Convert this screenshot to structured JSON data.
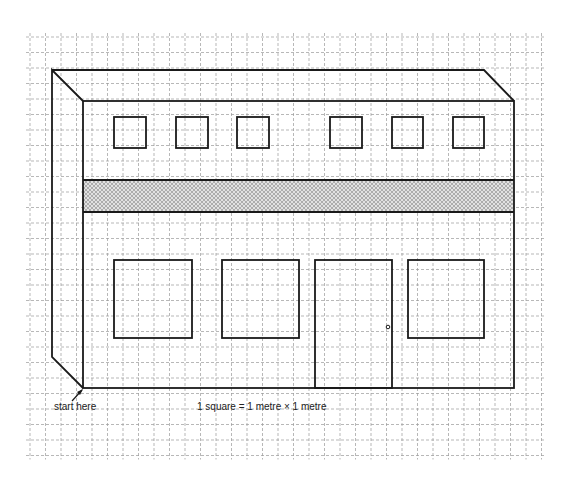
{
  "diagram": {
    "type": "isometric building elevation on square grid",
    "grid": {
      "origin_x": 30,
      "origin_y": 37,
      "spacing": 15.5,
      "cols": 33,
      "rows": 27,
      "color": "#9a9a9a"
    },
    "building": {
      "line_color": "#1a1a1a",
      "front_face": {
        "x1": 83,
        "y1": 101,
        "x2": 514,
        "y2": 388
      },
      "back_offset": {
        "dx": -31,
        "dy": -31
      },
      "roof_back_right_x": 484,
      "band": {
        "y1": 180,
        "y2": 212,
        "fill": "#cfcfcf"
      },
      "upper_windows": [
        {
          "x": 114,
          "y": 117,
          "w": 32,
          "h": 31
        },
        {
          "x": 176,
          "y": 117,
          "w": 32,
          "h": 31
        },
        {
          "x": 237,
          "y": 117,
          "w": 32,
          "h": 31
        },
        {
          "x": 330,
          "y": 117,
          "w": 32,
          "h": 31
        },
        {
          "x": 392,
          "y": 117,
          "w": 31,
          "h": 31
        },
        {
          "x": 453,
          "y": 117,
          "w": 31,
          "h": 31
        }
      ],
      "lower_windows": [
        {
          "x": 114,
          "y": 260,
          "w": 78,
          "h": 78
        },
        {
          "x": 222,
          "y": 260,
          "w": 77,
          "h": 78
        },
        {
          "x": 408,
          "y": 260,
          "w": 76,
          "h": 78
        }
      ],
      "door": {
        "x": 315,
        "y": 260,
        "w": 77,
        "h": 128,
        "knob_x": 388,
        "knob_y": 327
      }
    },
    "labels": {
      "start": "start here",
      "scale": "1 square = 1 metre × 1 metre"
    }
  }
}
